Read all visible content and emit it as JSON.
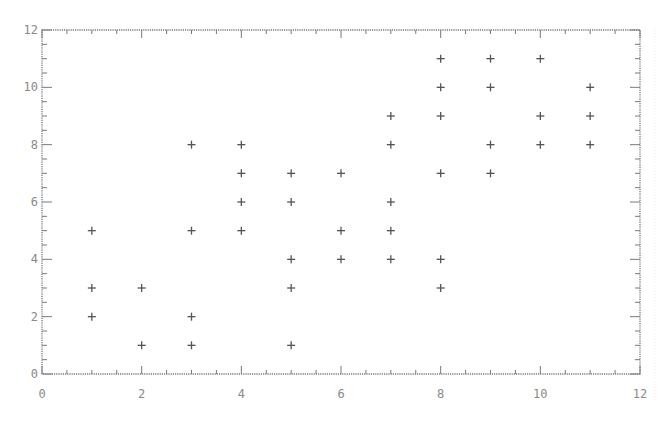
{
  "chart_data": {
    "type": "scatter",
    "title": "",
    "xlabel": "",
    "ylabel": "",
    "xlim": [
      0,
      12
    ],
    "ylim": [
      0,
      12
    ],
    "x_ticks": [
      0,
      2,
      4,
      6,
      8,
      10,
      12
    ],
    "y_ticks": [
      0,
      2,
      4,
      6,
      8,
      10,
      12
    ],
    "minor_tick_step": 0.5,
    "grid": false,
    "legend": null,
    "marker": "plus",
    "marker_color": "#555555",
    "axis_color": "#7a7a7a",
    "points": [
      {
        "x": 1,
        "y": 5
      },
      {
        "x": 1,
        "y": 3
      },
      {
        "x": 1,
        "y": 2
      },
      {
        "x": 2,
        "y": 3
      },
      {
        "x": 2,
        "y": 1
      },
      {
        "x": 3,
        "y": 8
      },
      {
        "x": 3,
        "y": 5
      },
      {
        "x": 3,
        "y": 2
      },
      {
        "x": 3,
        "y": 1
      },
      {
        "x": 4,
        "y": 8
      },
      {
        "x": 4,
        "y": 7
      },
      {
        "x": 4,
        "y": 6
      },
      {
        "x": 4,
        "y": 5
      },
      {
        "x": 5,
        "y": 7
      },
      {
        "x": 5,
        "y": 6
      },
      {
        "x": 5,
        "y": 4
      },
      {
        "x": 5,
        "y": 3
      },
      {
        "x": 5,
        "y": 1
      },
      {
        "x": 6,
        "y": 7
      },
      {
        "x": 6,
        "y": 5
      },
      {
        "x": 6,
        "y": 4
      },
      {
        "x": 7,
        "y": 9
      },
      {
        "x": 7,
        "y": 8
      },
      {
        "x": 7,
        "y": 6
      },
      {
        "x": 7,
        "y": 5
      },
      {
        "x": 7,
        "y": 4
      },
      {
        "x": 8,
        "y": 11
      },
      {
        "x": 8,
        "y": 10
      },
      {
        "x": 8,
        "y": 9
      },
      {
        "x": 8,
        "y": 7
      },
      {
        "x": 8,
        "y": 4
      },
      {
        "x": 8,
        "y": 3
      },
      {
        "x": 9,
        "y": 11
      },
      {
        "x": 9,
        "y": 10
      },
      {
        "x": 9,
        "y": 8
      },
      {
        "x": 9,
        "y": 7
      },
      {
        "x": 10,
        "y": 11
      },
      {
        "x": 10,
        "y": 9
      },
      {
        "x": 10,
        "y": 8
      },
      {
        "x": 11,
        "y": 10
      },
      {
        "x": 11,
        "y": 9
      },
      {
        "x": 11,
        "y": 8
      }
    ]
  }
}
